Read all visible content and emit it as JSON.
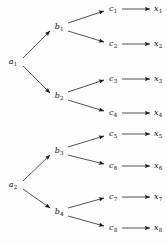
{
  "diagram": {
    "type": "binary-tree",
    "title": "",
    "canvas": {
      "width": 167,
      "height": 243
    },
    "colors": {
      "background": "#fdfdfd",
      "stroke": "#1a1a1a",
      "text": "#101010"
    },
    "levels": [
      {
        "name": "level-a",
        "prefix": "a",
        "count": 2
      },
      {
        "name": "level-b",
        "prefix": "b",
        "count": 4
      },
      {
        "name": "level-c",
        "prefix": "c",
        "count": 8
      },
      {
        "name": "level-x",
        "prefix": "x",
        "count": 8
      }
    ],
    "nodes": [
      {
        "id": "a1",
        "base": "a",
        "sub": "1",
        "x": 13,
        "y": 62,
        "level": "level-a"
      },
      {
        "id": "a2",
        "base": "a",
        "sub": "2",
        "x": 13,
        "y": 185,
        "level": "level-a"
      },
      {
        "id": "b1",
        "base": "b",
        "sub": "1",
        "x": 59,
        "y": 27,
        "level": "level-b"
      },
      {
        "id": "b2",
        "base": "b",
        "sub": "2",
        "x": 59,
        "y": 96,
        "level": "level-b"
      },
      {
        "id": "b3",
        "base": "b",
        "sub": "3",
        "x": 59,
        "y": 151,
        "level": "level-b"
      },
      {
        "id": "b4",
        "base": "b",
        "sub": "4",
        "x": 59,
        "y": 212,
        "level": "level-b"
      },
      {
        "id": "c1",
        "base": "c",
        "sub": "1",
        "x": 113,
        "y": 9,
        "level": "level-c"
      },
      {
        "id": "c2",
        "base": "c",
        "sub": "2",
        "x": 113,
        "y": 44,
        "level": "level-c"
      },
      {
        "id": "c3",
        "base": "c",
        "sub": "3",
        "x": 113,
        "y": 79,
        "level": "level-c"
      },
      {
        "id": "c4",
        "base": "c",
        "sub": "4",
        "x": 113,
        "y": 113,
        "level": "level-c"
      },
      {
        "id": "c5",
        "base": "c",
        "sub": "5",
        "x": 113,
        "y": 134,
        "level": "level-c"
      },
      {
        "id": "c6",
        "base": "c",
        "sub": "6",
        "x": 113,
        "y": 166,
        "level": "level-c"
      },
      {
        "id": "c7",
        "base": "c",
        "sub": "7",
        "x": 113,
        "y": 197,
        "level": "level-c"
      },
      {
        "id": "c8",
        "base": "c",
        "sub": "8",
        "x": 113,
        "y": 228,
        "level": "level-c"
      },
      {
        "id": "x1",
        "base": "x",
        "sub": "1",
        "x": 158,
        "y": 9,
        "level": "level-x"
      },
      {
        "id": "x2",
        "base": "x",
        "sub": "2",
        "x": 158,
        "y": 44,
        "level": "level-x"
      },
      {
        "id": "x3",
        "base": "x",
        "sub": "3",
        "x": 158,
        "y": 79,
        "level": "level-x"
      },
      {
        "id": "x4",
        "base": "x",
        "sub": "4",
        "x": 158,
        "y": 113,
        "level": "level-x"
      },
      {
        "id": "x5",
        "base": "x",
        "sub": "5",
        "x": 158,
        "y": 134,
        "level": "level-x"
      },
      {
        "id": "x6",
        "base": "x",
        "sub": "6",
        "x": 158,
        "y": 166,
        "level": "level-x"
      },
      {
        "id": "x7",
        "base": "x",
        "sub": "7",
        "x": 158,
        "y": 197,
        "level": "level-x"
      },
      {
        "id": "x8",
        "base": "x",
        "sub": "8",
        "x": 158,
        "y": 228,
        "level": "level-x"
      }
    ],
    "edges": [
      {
        "id": "a1-b1",
        "from": "a1",
        "to": "b1",
        "x1": 23,
        "y1": 58,
        "x2": 50,
        "y2": 31,
        "kind": "diagonal-up"
      },
      {
        "id": "a1-b2",
        "from": "a1",
        "to": "b2",
        "x1": 23,
        "y1": 66,
        "x2": 50,
        "y2": 93,
        "kind": "diagonal-down"
      },
      {
        "id": "a2-b3",
        "from": "a2",
        "to": "b3",
        "x1": 23,
        "y1": 181,
        "x2": 50,
        "y2": 155,
        "kind": "diagonal-up"
      },
      {
        "id": "a2-b4",
        "from": "a2",
        "to": "b4",
        "x1": 23,
        "y1": 189,
        "x2": 50,
        "y2": 208,
        "kind": "diagonal-down"
      },
      {
        "id": "b1-c1",
        "from": "b1",
        "to": "c1",
        "x1": 68,
        "y1": 23,
        "x2": 104,
        "y2": 11,
        "kind": "diagonal-up"
      },
      {
        "id": "b1-c2",
        "from": "b1",
        "to": "c2",
        "x1": 68,
        "y1": 31,
        "x2": 104,
        "y2": 42,
        "kind": "diagonal-down"
      },
      {
        "id": "b2-c3",
        "from": "b2",
        "to": "c3",
        "x1": 68,
        "y1": 92,
        "x2": 104,
        "y2": 80,
        "kind": "diagonal-up"
      },
      {
        "id": "b2-c4",
        "from": "b2",
        "to": "c4",
        "x1": 68,
        "y1": 100,
        "x2": 104,
        "y2": 111,
        "kind": "diagonal-down"
      },
      {
        "id": "b3-c5",
        "from": "b3",
        "to": "c5",
        "x1": 68,
        "y1": 147,
        "x2": 104,
        "y2": 136,
        "kind": "diagonal-up"
      },
      {
        "id": "b3-c6",
        "from": "b3",
        "to": "c6",
        "x1": 68,
        "y1": 155,
        "x2": 104,
        "y2": 164,
        "kind": "diagonal-down"
      },
      {
        "id": "b4-c7",
        "from": "b4",
        "to": "c7",
        "x1": 68,
        "y1": 208,
        "x2": 104,
        "y2": 198,
        "kind": "diagonal-up"
      },
      {
        "id": "b4-c8",
        "from": "b4",
        "to": "c8",
        "x1": 68,
        "y1": 216,
        "x2": 104,
        "y2": 226,
        "kind": "diagonal-down"
      },
      {
        "id": "c1-x1",
        "from": "c1",
        "to": "x1",
        "x1": 122,
        "y1": 9,
        "x2": 150,
        "y2": 9,
        "kind": "horizontal"
      },
      {
        "id": "c2-x2",
        "from": "c2",
        "to": "x2",
        "x1": 122,
        "y1": 44,
        "x2": 150,
        "y2": 44,
        "kind": "horizontal"
      },
      {
        "id": "c3-x3",
        "from": "c3",
        "to": "x3",
        "x1": 122,
        "y1": 79,
        "x2": 150,
        "y2": 79,
        "kind": "horizontal"
      },
      {
        "id": "c4-x4",
        "from": "c4",
        "to": "x4",
        "x1": 122,
        "y1": 113,
        "x2": 150,
        "y2": 113,
        "kind": "horizontal"
      },
      {
        "id": "c5-x5",
        "from": "c5",
        "to": "x5",
        "x1": 122,
        "y1": 134,
        "x2": 150,
        "y2": 134,
        "kind": "horizontal"
      },
      {
        "id": "c6-x6",
        "from": "c6",
        "to": "x6",
        "x1": 122,
        "y1": 166,
        "x2": 150,
        "y2": 166,
        "kind": "horizontal"
      },
      {
        "id": "c7-x7",
        "from": "c7",
        "to": "x7",
        "x1": 122,
        "y1": 197,
        "x2": 150,
        "y2": 197,
        "kind": "horizontal"
      },
      {
        "id": "c8-x8",
        "from": "c8",
        "to": "x8",
        "x1": 122,
        "y1": 228,
        "x2": 150,
        "y2": 228,
        "kind": "horizontal"
      }
    ]
  }
}
